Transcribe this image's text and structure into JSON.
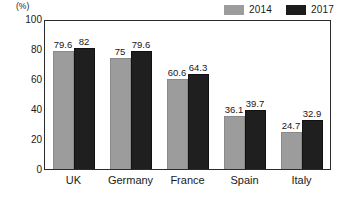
{
  "chart_data": {
    "type": "bar",
    "title": "",
    "xlabel": "",
    "ylabel": "(%)",
    "unit_label": "(%)",
    "categories": [
      "UK",
      "Germany",
      "France",
      "Spain",
      "Italy"
    ],
    "series": [
      {
        "name": "2014",
        "color": "#9c9c9c",
        "values": [
          79.6,
          75,
          60.6,
          36.1,
          24.7
        ]
      },
      {
        "name": "2017",
        "color": "#1f1f1f",
        "values": [
          82,
          79.6,
          64.3,
          39.7,
          32.9
        ]
      }
    ],
    "value_labels": {
      "2014": [
        "79.6",
        "75",
        "60.6",
        "36.1",
        "24.7"
      ],
      "2017": [
        "82",
        "79.6",
        "64.3",
        "39.7",
        "32.9"
      ]
    },
    "ylim": [
      0,
      100
    ],
    "yticks": [
      100,
      80,
      60,
      40,
      20,
      0
    ],
    "ytick_labels": [
      "100",
      "80",
      "60",
      "40",
      "20",
      "0"
    ],
    "grid": false,
    "legend_position": "top-right",
    "frame": true
  },
  "legend": {
    "items": [
      {
        "label": "2014",
        "color": "#9c9c9c"
      },
      {
        "label": "2017",
        "color": "#1f1f1f"
      }
    ]
  },
  "colors": {
    "series_2014": "#9c9c9c",
    "series_2017": "#1f1f1f",
    "frame": "#2b2b2b",
    "text": "#161616",
    "background": "#ffffff"
  }
}
